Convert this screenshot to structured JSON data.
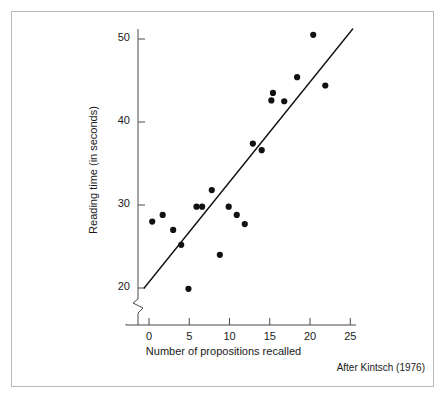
{
  "figure": {
    "source_note": "After Kintsch (1976)"
  },
  "chart_data": {
    "type": "scatter",
    "title": "",
    "xlabel": "Number of propositions recalled",
    "ylabel": "Reading time (in seconds)",
    "xlim": [
      -2,
      26
    ],
    "ylim": [
      18.5,
      51.8
    ],
    "grid": false,
    "legend": null,
    "axis_break": {
      "axis": "y",
      "note": "zigzag break below 20 on the vertical axis"
    },
    "xticks": [
      0,
      5,
      10,
      15,
      20,
      25
    ],
    "xtick_labels": [
      "0",
      "5",
      "10",
      "15",
      "20",
      "25"
    ],
    "yticks": [
      20,
      30,
      40,
      50
    ],
    "ytick_labels": [
      "20",
      "30",
      "40",
      "50"
    ],
    "points": [
      {
        "x": 0.4,
        "y": 28.0
      },
      {
        "x": 1.7,
        "y": 28.8
      },
      {
        "x": 3.0,
        "y": 27.0
      },
      {
        "x": 4.0,
        "y": 25.2
      },
      {
        "x": 4.9,
        "y": 19.9
      },
      {
        "x": 5.9,
        "y": 29.8
      },
      {
        "x": 6.6,
        "y": 29.8
      },
      {
        "x": 7.8,
        "y": 31.8
      },
      {
        "x": 8.8,
        "y": 24.0
      },
      {
        "x": 9.9,
        "y": 29.8
      },
      {
        "x": 10.9,
        "y": 28.8
      },
      {
        "x": 11.9,
        "y": 27.7
      },
      {
        "x": 12.9,
        "y": 37.4
      },
      {
        "x": 14.0,
        "y": 36.6
      },
      {
        "x": 15.2,
        "y": 42.6
      },
      {
        "x": 15.4,
        "y": 43.5
      },
      {
        "x": 16.8,
        "y": 42.5
      },
      {
        "x": 18.4,
        "y": 45.4
      },
      {
        "x": 20.4,
        "y": 50.5
      },
      {
        "x": 21.9,
        "y": 44.4
      }
    ],
    "fit_line": {
      "label": "regression line",
      "x_start": -0.6,
      "y_start": 20.0,
      "x_end": 25.3,
      "y_end": 51.2
    }
  },
  "axis_ticks": {
    "y": [
      {
        "label": "50",
        "value": 50
      },
      {
        "label": "40",
        "value": 40
      },
      {
        "label": "30",
        "value": 30
      },
      {
        "label": "20",
        "value": 20
      }
    ],
    "x": [
      {
        "label": "0",
        "value": 0
      },
      {
        "label": "5",
        "value": 5
      },
      {
        "label": "10",
        "value": 10
      },
      {
        "label": "15",
        "value": 15
      },
      {
        "label": "20",
        "value": 20
      },
      {
        "label": "25",
        "value": 25
      }
    ]
  }
}
